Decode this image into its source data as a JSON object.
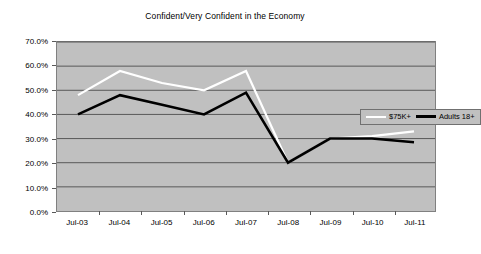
{
  "chart_data": {
    "type": "line",
    "title": "Confident/Very Confident in the Economy",
    "xlabel": "",
    "ylabel": "",
    "categories": [
      "Jul-03",
      "Jul-04",
      "Jul-05",
      "Jul-06",
      "Jul-07",
      "Jul-08",
      "Jul-09",
      "Jul-10",
      "Jul-11"
    ],
    "ylim": [
      0,
      70
    ],
    "ytick_values": [
      0,
      10,
      20,
      30,
      40,
      50,
      60,
      70
    ],
    "ytick_labels": [
      "0.0%",
      "10.0%",
      "20.0%",
      "30.0%",
      "40.0%",
      "50.0%",
      "60.0%",
      "70.0%"
    ],
    "grid": true,
    "legend_position": "inside-top-right",
    "plot_background": "#c0c0c0",
    "series": [
      {
        "name": "$75K+",
        "color": "#ffffff",
        "values": [
          48,
          58,
          53,
          50,
          58,
          20,
          30,
          31,
          33
        ]
      },
      {
        "name": "Adults 18+",
        "color": "#000000",
        "values": [
          40,
          48,
          44,
          40,
          49,
          20,
          30,
          30,
          28.5
        ]
      }
    ]
  },
  "legend": {
    "items": [
      {
        "label": "$75K+",
        "swatch": "white-line-swatch"
      },
      {
        "label": "Adults 18+",
        "swatch": "black-line-swatch"
      }
    ]
  }
}
